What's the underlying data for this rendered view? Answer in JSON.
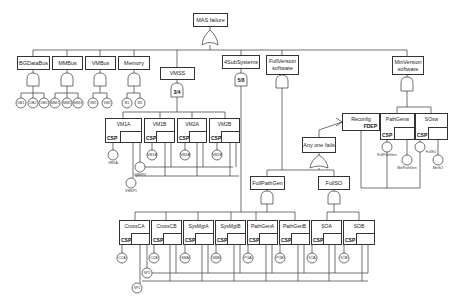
{
  "top_event": "MAS failure",
  "level1": {
    "bgdatabus": "BGDataBus",
    "mmbus": "MMBus",
    "vmbus": "VMBus",
    "memory": "Memory",
    "vmss": "VMSS",
    "subsystems": "4SubSystems",
    "fullversion": "FullVersion software",
    "minversion": "MinVersion software"
  },
  "gates": {
    "vmss_kofn": "3/4",
    "subsystems_kofn": "5/8"
  },
  "basic_events": {
    "db": [
      "DB1",
      "DB2",
      "DB3"
    ],
    "mm": [
      "MM1",
      "MM2",
      "MM3"
    ],
    "vm": [
      "VM1",
      "VM2"
    ],
    "mem": [
      "M1",
      "M2"
    ],
    "vms": [
      "VM1A",
      "VM1B",
      "VM2A",
      "VM2B"
    ],
    "vmsp": [
      "VMSP2",
      "VMSP1"
    ],
    "sub": [
      "CCA",
      "CCB",
      "SMA",
      "SMB",
      "PGA",
      "PGB",
      "SOA",
      "SOB"
    ],
    "sp": [
      "SP2",
      "SP1"
    ],
    "sw": [
      "FullPathGen",
      "MinPathGen",
      "FullSO",
      "MinSO"
    ]
  },
  "vm_spares": [
    "VM1A",
    "VM1B",
    "VM2A",
    "VM2B"
  ],
  "csp_label": "CSP",
  "reconfig": {
    "label": "Reconfig",
    "type": "FDEP"
  },
  "sw_spares": [
    "PathGenw",
    "SOsw"
  ],
  "any_one_fails": "Any one fails",
  "full_path_gen": "FullPathGen",
  "full_so": "FullSO",
  "sub_spares": [
    "CrossCA",
    "CrossCB",
    "SysMgtA",
    "SysMgtB",
    "PathGenA",
    "PathGenB",
    "SOA",
    "SOB"
  ]
}
